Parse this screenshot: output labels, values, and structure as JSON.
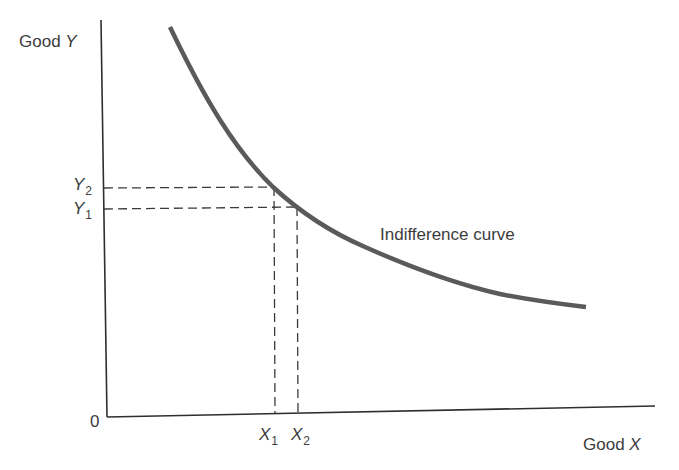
{
  "diagram": {
    "type": "indifference-curve",
    "axes": {
      "y_label_word": "Good",
      "y_label_var": "Y",
      "x_label_word": "Good",
      "x_label_var": "X",
      "origin_label": "0"
    },
    "curve": {
      "label": "Indifference curve",
      "color": "#5a5a5a"
    },
    "y_ticks": [
      {
        "var": "Y",
        "sub": "2"
      },
      {
        "var": "Y",
        "sub": "1"
      }
    ],
    "x_ticks": [
      {
        "var": "X",
        "sub": "1"
      },
      {
        "var": "X",
        "sub": "2"
      }
    ],
    "colors": {
      "axis": "#2e2e2e",
      "curve": "#5a5a5a",
      "dashed": "#3a3a3a",
      "text": "#3c3c3c"
    }
  }
}
